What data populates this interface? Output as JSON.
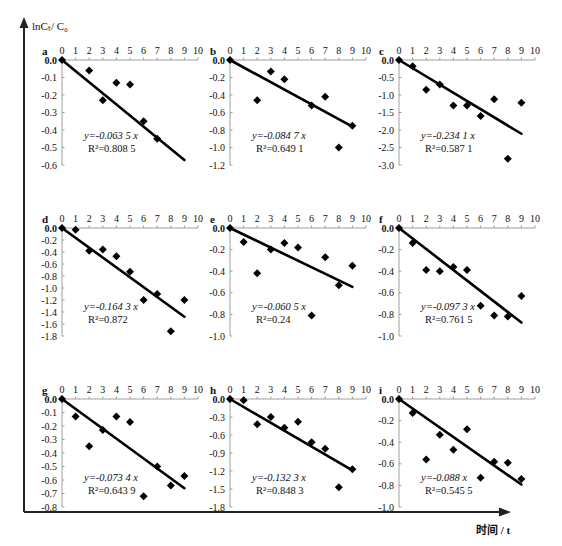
{
  "figure": {
    "y_axis_label": "lnCₜ/ C₀",
    "x_axis_label": "时间 / t",
    "colors": {
      "ink": "#111111",
      "axis": "#333333",
      "tick": "#888888"
    }
  },
  "chart_data": [
    {
      "type": "scatter",
      "panel": "a",
      "x": [
        0,
        2,
        3,
        4,
        5,
        6,
        7
      ],
      "y": [
        0.0,
        -0.06,
        -0.23,
        -0.13,
        -0.14,
        -0.35,
        -0.45
      ],
      "xlim": [
        0,
        10
      ],
      "ylim": [
        -0.6,
        0.0
      ],
      "yticks": [
        0.0,
        -0.1,
        -0.2,
        -0.3,
        -0.4,
        -0.5,
        -0.6
      ],
      "ydec": 1,
      "fit": {
        "slope": -0.0635,
        "x_end": 9
      },
      "equation": "y=-0.063 5 x",
      "r2": "R²=0.808 5"
    },
    {
      "type": "scatter",
      "panel": "b",
      "x": [
        0,
        2,
        3,
        4,
        6,
        7,
        8,
        9
      ],
      "y": [
        0.0,
        -0.46,
        -0.13,
        -0.22,
        -0.52,
        -0.42,
        -1.0,
        -0.75
      ],
      "xlim": [
        0,
        10
      ],
      "ylim": [
        -1.2,
        0.0
      ],
      "yticks": [
        0.0,
        -0.2,
        -0.4,
        -0.6,
        -0.8,
        -1.0,
        -1.2
      ],
      "ydec": 1,
      "fit": {
        "slope": -0.0847,
        "x_end": 9
      },
      "equation": "y=-0.084 7 x",
      "r2": "R²=0.649 1"
    },
    {
      "type": "scatter",
      "panel": "c",
      "x": [
        0,
        1,
        2,
        3,
        4,
        5,
        6,
        7,
        8,
        9
      ],
      "y": [
        0.0,
        -0.18,
        -0.85,
        -0.7,
        -1.3,
        -1.3,
        -1.6,
        -1.12,
        -2.82,
        -1.22
      ],
      "xlim": [
        0,
        10
      ],
      "ylim": [
        -3.0,
        0.0
      ],
      "yticks": [
        0.0,
        -0.5,
        -1.0,
        -1.5,
        -2.0,
        -2.5,
        -3.0
      ],
      "ydec": 1,
      "fit": {
        "slope": -0.2341,
        "x_end": 9
      },
      "equation": "y=-0.234 1 x",
      "r2": "R²=0.587 1"
    },
    {
      "type": "scatter",
      "panel": "d",
      "x": [
        0,
        1,
        2,
        3,
        4,
        5,
        6,
        7,
        8,
        9
      ],
      "y": [
        0.0,
        -0.03,
        -0.38,
        -0.36,
        -0.47,
        -0.73,
        -1.2,
        -1.1,
        -1.72,
        -1.2
      ],
      "xlim": [
        0,
        10
      ],
      "ylim": [
        -1.8,
        0.0
      ],
      "yticks": [
        0.0,
        -0.2,
        -0.4,
        -0.6,
        -0.8,
        -1.0,
        -1.2,
        -1.4,
        -1.6,
        -1.8
      ],
      "ydec": 1,
      "fit": {
        "slope": -0.1643,
        "x_end": 9
      },
      "equation": "y=-0.164 3 x",
      "r2": "R²=0.872"
    },
    {
      "type": "scatter",
      "panel": "e",
      "x": [
        0,
        1,
        2,
        3,
        4,
        5,
        6,
        7,
        8,
        9
      ],
      "y": [
        0.0,
        -0.13,
        -0.42,
        -0.2,
        -0.14,
        -0.18,
        -0.81,
        -0.27,
        -0.53,
        -0.35
      ],
      "xlim": [
        0,
        10
      ],
      "ylim": [
        -1.0,
        0.0
      ],
      "yticks": [
        0.0,
        -0.2,
        -0.4,
        -0.6,
        -0.8,
        -1.0
      ],
      "ydec": 1,
      "fit": {
        "slope": -0.0605,
        "x_end": 9
      },
      "equation": "y=-0.060 5 x",
      "r2": "R²=0.24"
    },
    {
      "type": "scatter",
      "panel": "f",
      "x": [
        0,
        1,
        2,
        3,
        4,
        5,
        6,
        7,
        8,
        9
      ],
      "y": [
        0.0,
        -0.14,
        -0.39,
        -0.4,
        -0.36,
        -0.39,
        -0.72,
        -0.81,
        -0.82,
        -0.63
      ],
      "xlim": [
        0,
        10
      ],
      "ylim": [
        -1.0,
        0.0
      ],
      "yticks": [
        0.0,
        -0.2,
        -0.4,
        -0.6,
        -0.8,
        -1.0
      ],
      "ydec": 1,
      "fit": {
        "slope": -0.0973,
        "x_end": 9
      },
      "equation": "y=-0.097 3 x",
      "r2": "R²=0.761 5"
    },
    {
      "type": "scatter",
      "panel": "g",
      "x": [
        0,
        1,
        2,
        3,
        4,
        5,
        6,
        7,
        8,
        9
      ],
      "y": [
        0.0,
        -0.13,
        -0.35,
        -0.23,
        -0.13,
        -0.17,
        -0.72,
        -0.5,
        -0.64,
        -0.57
      ],
      "xlim": [
        0,
        10
      ],
      "ylim": [
        -0.8,
        0.0
      ],
      "yticks": [
        0.0,
        -0.1,
        -0.2,
        -0.3,
        -0.4,
        -0.5,
        -0.6,
        -0.7,
        -0.8
      ],
      "ydec": 1,
      "fit": {
        "slope": -0.0734,
        "x_end": 9
      },
      "equation": "y=-0.073 4 x",
      "r2": "R²=0.643 9"
    },
    {
      "type": "scatter",
      "panel": "h",
      "x": [
        0,
        1,
        2,
        3,
        4,
        5,
        6,
        7,
        8,
        9
      ],
      "y": [
        0.0,
        -0.02,
        -0.42,
        -0.3,
        -0.48,
        -0.38,
        -0.72,
        -0.83,
        -1.47,
        -1.17
      ],
      "xlim": [
        0,
        10
      ],
      "ylim": [
        -1.8,
        0.0
      ],
      "yticks": [
        0.0,
        -0.3,
        -0.6,
        -0.9,
        -1.2,
        -1.5,
        -1.8
      ],
      "ydec": 1,
      "fit": {
        "slope": -0.1323,
        "x_end": 9
      },
      "equation": "y=-0.132 3 x",
      "r2": "R²=0.848 3"
    },
    {
      "type": "scatter",
      "panel": "i",
      "x": [
        0,
        1,
        2,
        3,
        4,
        5,
        6,
        7,
        8,
        9
      ],
      "y": [
        0.0,
        -0.13,
        -0.56,
        -0.33,
        -0.47,
        -0.28,
        -0.73,
        -0.58,
        -0.59,
        -0.74
      ],
      "xlim": [
        0,
        10
      ],
      "ylim": [
        -1.0,
        0.0
      ],
      "yticks": [
        0.0,
        -0.2,
        -0.4,
        -0.6,
        -0.8,
        -1.0
      ],
      "ydec": 1,
      "fit": {
        "slope": -0.088,
        "x_end": 9
      },
      "equation": "y=-0.088 x",
      "r2": "R²=0.545 5"
    }
  ]
}
